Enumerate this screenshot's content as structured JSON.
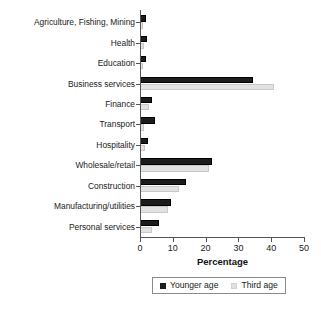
{
  "chart_data": {
    "type": "bar",
    "orientation": "horizontal",
    "title": "",
    "xlabel": "Percentage",
    "ylabel": "",
    "xlim": [
      0,
      50
    ],
    "xticks": [
      0,
      10,
      20,
      30,
      40,
      50
    ],
    "grid": false,
    "legend_position": "bottom",
    "categories": [
      "Agriculture, Fishing, Mining",
      "Health",
      "Education",
      "Business services",
      "Finance",
      "Transport",
      "Hospitality",
      "Wholesale/retail",
      "Construction",
      "Manufacturing/utilities",
      "Personal services"
    ],
    "series": [
      {
        "name": "Younger age",
        "color": "#1c1c1c",
        "values": [
          1.8,
          2.0,
          1.8,
          34.5,
          3.7,
          4.7,
          2.5,
          22.0,
          14.0,
          9.5,
          5.8
        ]
      },
      {
        "name": "Third age",
        "color": "#e2e2e2",
        "values": [
          1.0,
          1.2,
          1.0,
          41.0,
          2.8,
          1.2,
          1.5,
          21.0,
          12.0,
          8.5,
          3.7
        ]
      }
    ]
  },
  "axis": {
    "x_title": "Percentage",
    "tick_labels": [
      "0",
      "10",
      "20",
      "30",
      "40",
      "50"
    ]
  },
  "legend": {
    "items": [
      {
        "label": "Younger age"
      },
      {
        "label": "Third age"
      }
    ]
  }
}
